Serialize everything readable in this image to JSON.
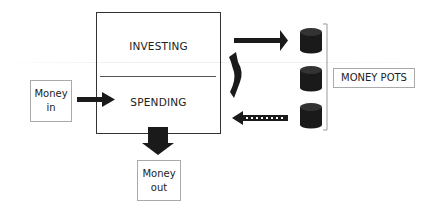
{
  "diagram": {
    "main_box": {
      "top_section": "INVESTING",
      "bottom_section": "SPENDING"
    },
    "money_in": {
      "line1": "Money",
      "line2": "in"
    },
    "money_out": {
      "line1": "Money",
      "line2": "out"
    },
    "money_pots_label": "MONEY POTS",
    "pots_count": 3,
    "arrows": [
      {
        "from": "money-in",
        "to": "spending",
        "style": "solid"
      },
      {
        "from": "spending",
        "to": "money-out",
        "style": "solid-down"
      },
      {
        "from": "investing",
        "to": "money-pots",
        "style": "solid"
      },
      {
        "from": "money-pots",
        "to": "spending",
        "style": "dotted"
      },
      {
        "from": "investing",
        "to": "spending",
        "style": "curved"
      }
    ],
    "colors": {
      "stroke": "#333333",
      "fill": "#1a1a1a",
      "box_border": "#aaaaaa"
    }
  }
}
